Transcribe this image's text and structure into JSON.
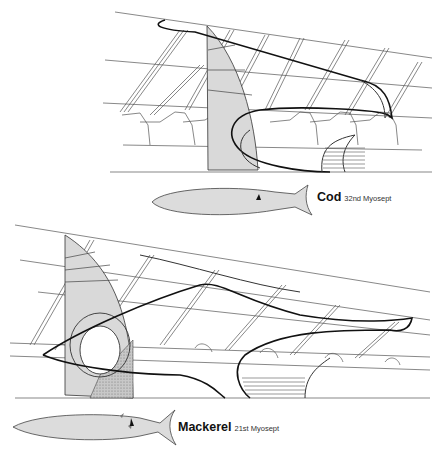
{
  "figure": {
    "panels": [
      {
        "id": "cod",
        "species": "Cod",
        "myosept": "32nd Myosept"
      },
      {
        "id": "mackerel",
        "species": "Mackerel",
        "myosept": "21st Myosept"
      }
    ],
    "colors": {
      "fill_light": "#d9d9d9",
      "fill_dark": "#b5b5b5",
      "fish_body": "#dcdcdc",
      "lines": "#222222"
    }
  }
}
